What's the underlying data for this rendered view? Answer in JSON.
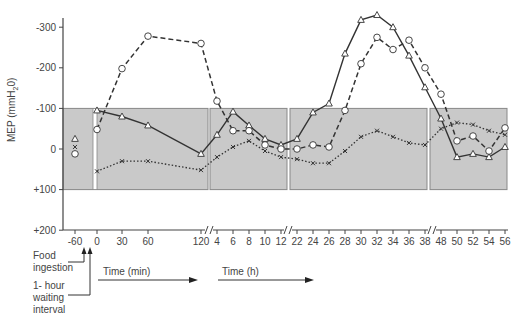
{
  "chart_data": {
    "type": "line",
    "title": "",
    "ylabel": "MEP (mmH2O)",
    "ylabel_parts": {
      "main": "MEP (mmH",
      "sub": "2",
      "tail": "0)"
    },
    "ylim": [
      200,
      -300
    ],
    "yticks": [
      "-300",
      "-200",
      "-100",
      "0",
      "+100",
      "+200"
    ],
    "ytick_values": [
      -300,
      -200,
      -100,
      0,
      100,
      200
    ],
    "x_segments": [
      {
        "unit": "min",
        "ticks": [
          "-60",
          "0",
          "30",
          "60",
          "120"
        ]
      },
      {
        "unit": "h",
        "ticks": [
          "4",
          "6",
          "8",
          "10",
          "12"
        ]
      },
      {
        "unit": "h",
        "ticks": [
          "22",
          "24",
          "26",
          "28",
          "30",
          "32",
          "34",
          "36",
          "38"
        ]
      },
      {
        "unit": "h",
        "ticks": [
          "48",
          "50",
          "52",
          "54",
          "56"
        ]
      }
    ],
    "x_categories": [
      "-60",
      "0",
      "30",
      "60",
      "120",
      "4",
      "6",
      "8",
      "10",
      "12",
      "22",
      "24",
      "26",
      "28",
      "30",
      "32",
      "34",
      "36",
      "38",
      "48",
      "50",
      "52",
      "54",
      "56"
    ],
    "normal_band": {
      "from": -100,
      "to": 100,
      "shaded": true
    },
    "series": [
      {
        "name": "triangle-solid",
        "marker": "triangle",
        "line": "solid",
        "points": [
          [
            "-60",
            -25
          ],
          [
            "0",
            -95
          ],
          [
            "30",
            -80
          ],
          [
            "60",
            -58
          ],
          [
            "120",
            12
          ],
          [
            "4",
            -35
          ],
          [
            "6",
            -92
          ],
          [
            "8",
            -58
          ],
          [
            "10",
            -25
          ],
          [
            "12",
            -10
          ],
          [
            "22",
            -25
          ],
          [
            "24",
            -90
          ],
          [
            "26",
            -112
          ],
          [
            "28",
            -235
          ],
          [
            "30",
            -318
          ],
          [
            "32",
            -330
          ],
          [
            "34",
            -300
          ],
          [
            "36",
            -230
          ],
          [
            "38",
            -152
          ],
          [
            "48",
            -75
          ],
          [
            "50",
            20
          ],
          [
            "52",
            12
          ],
          [
            "54",
            20
          ],
          [
            "56",
            -5
          ]
        ]
      },
      {
        "name": "circle-dashed",
        "marker": "circle",
        "line": "dashed",
        "points": [
          [
            "-60",
            12
          ],
          [
            "0",
            -48
          ],
          [
            "30",
            -198
          ],
          [
            "60",
            -278
          ],
          [
            "120",
            -260
          ],
          [
            "4",
            -118
          ],
          [
            "6",
            -45
          ],
          [
            "8",
            -45
          ],
          [
            "10",
            -10
          ],
          [
            "12",
            0
          ],
          [
            "22",
            0
          ],
          [
            "24",
            -10
          ],
          [
            "26",
            -5
          ],
          [
            "28",
            -95
          ],
          [
            "30",
            -210
          ],
          [
            "32",
            -275
          ],
          [
            "34",
            -245
          ],
          [
            "36",
            -268
          ],
          [
            "38",
            -200
          ],
          [
            "48",
            -135
          ],
          [
            "50",
            -20
          ],
          [
            "52",
            -32
          ],
          [
            "54",
            5
          ],
          [
            "56",
            -52
          ]
        ]
      },
      {
        "name": "x-dotted",
        "marker": "x",
        "line": "dotted",
        "points": [
          [
            "-60",
            -5
          ],
          [
            "0",
            55
          ],
          [
            "30",
            30
          ],
          [
            "60",
            30
          ],
          [
            "120",
            52
          ],
          [
            "4",
            20
          ],
          [
            "6",
            -5
          ],
          [
            "8",
            -20
          ],
          [
            "10",
            5
          ],
          [
            "12",
            20
          ],
          [
            "22",
            25
          ],
          [
            "24",
            35
          ],
          [
            "26",
            35
          ],
          [
            "28",
            5
          ],
          [
            "30",
            -30
          ],
          [
            "32",
            -45
          ],
          [
            "34",
            -30
          ],
          [
            "36",
            -15
          ],
          [
            "38",
            -10
          ],
          [
            "48",
            -50
          ],
          [
            "50",
            -65
          ],
          [
            "52",
            -60
          ],
          [
            "54",
            -45
          ],
          [
            "56",
            -35
          ]
        ]
      }
    ],
    "annotations": [
      {
        "text_lines": [
          "Food",
          "ingestion"
        ],
        "points_to": "-30"
      },
      {
        "text_lines": [
          "1- hour",
          "waiting",
          "interval"
        ],
        "points_to": "-15"
      }
    ],
    "time_arrows": [
      {
        "label": "Time (min)"
      },
      {
        "label": "Time (h)"
      }
    ],
    "colors": {
      "band": "#c9c9c9",
      "band_border": "#888888",
      "lines": "#333333",
      "axis": "#444444"
    }
  }
}
